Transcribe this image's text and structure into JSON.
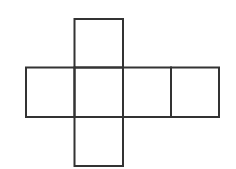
{
  "diagram": {
    "type": "cube-net",
    "stroke_color": "#333333",
    "stroke_width": 2,
    "background": "#ffffff",
    "face_size": 48.5,
    "faces": [
      {
        "id": "top",
        "x": 74.5,
        "y": 19,
        "w": 48.5,
        "h": 48.5
      },
      {
        "id": "middle-left",
        "x": 26,
        "y": 67.5,
        "w": 48.5,
        "h": 49.5
      },
      {
        "id": "middle-center",
        "x": 74.5,
        "y": 67.5,
        "w": 48.5,
        "h": 49.5
      },
      {
        "id": "middle-right",
        "x": 123,
        "y": 67.5,
        "w": 48,
        "h": 49.5
      },
      {
        "id": "far-right",
        "x": 171,
        "y": 67.5,
        "w": 48,
        "h": 49.5
      },
      {
        "id": "bottom",
        "x": 74.5,
        "y": 117,
        "w": 48.5,
        "h": 49
      }
    ]
  }
}
